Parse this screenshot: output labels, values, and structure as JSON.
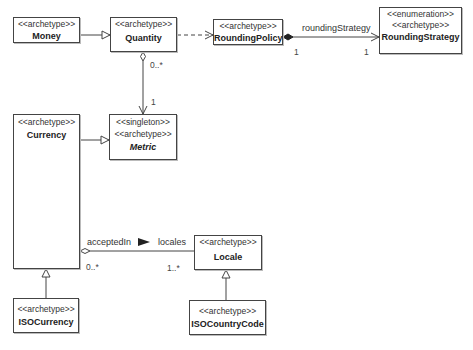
{
  "classes": {
    "money": {
      "stereotypes": [
        "<<archetype>>"
      ],
      "name": "Money"
    },
    "quantity": {
      "stereotypes": [
        "<<archetype>>"
      ],
      "name": "Quantity"
    },
    "rounding_policy": {
      "stereotypes": [
        "<<archetype>>"
      ],
      "name": "RoundingPolicy"
    },
    "rounding_strategy": {
      "stereotypes": [
        "<<enumeration>>",
        "<<archetype>>"
      ],
      "name": "RoundingStrategy"
    },
    "currency": {
      "stereotypes": [
        "<<archetype>>"
      ],
      "name": "Currency"
    },
    "metric": {
      "stereotypes": [
        "<<singleton>>",
        "<<archetype>>"
      ],
      "name": "Metric"
    },
    "locale": {
      "stereotypes": [
        "<<archetype>>"
      ],
      "name": "Locale"
    },
    "iso_currency": {
      "stereotypes": [
        "<<archetype>>"
      ],
      "name": "ISOCurrency"
    },
    "iso_country_code": {
      "stereotypes": [
        "<<archetype>>"
      ],
      "name": "ISOCountryCode"
    }
  },
  "relations": {
    "rounding_strategy_role": "roundingStrategy",
    "rounding_policy_mult": "1",
    "rounding_strategy_mult": "1",
    "quantity_mult": "0..*",
    "metric_mult": "1",
    "accepted_in_label": "acceptedIn",
    "locales_role": "locales",
    "currency_mult": "0..*",
    "locale_mult": "1..*"
  }
}
